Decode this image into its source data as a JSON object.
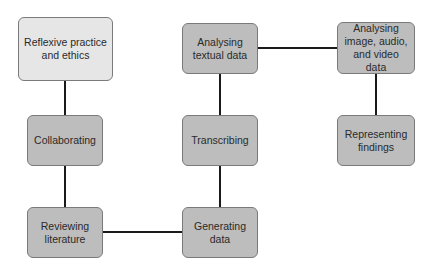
{
  "diagram": {
    "type": "flow",
    "nodes": [
      {
        "id": "reflexive",
        "label": "Reflexive practice\nand ethics",
        "fill": "#e6e6e6",
        "x": 18,
        "y": 17,
        "w": 95,
        "h": 64
      },
      {
        "id": "collaborating",
        "label": "Collaborating",
        "fill": "#bdbdbd",
        "x": 27,
        "y": 115,
        "w": 76,
        "h": 51
      },
      {
        "id": "reviewing",
        "label": "Reviewing\nliterature",
        "fill": "#bdbdbd",
        "x": 27,
        "y": 207,
        "w": 76,
        "h": 51
      },
      {
        "id": "generating",
        "label": "Generating\ndata",
        "fill": "#bdbdbd",
        "x": 182,
        "y": 207,
        "w": 76,
        "h": 51
      },
      {
        "id": "transcribing",
        "label": "Transcribing",
        "fill": "#bdbdbd",
        "x": 182,
        "y": 115,
        "w": 76,
        "h": 51
      },
      {
        "id": "textual",
        "label": "Analysing\ntextual data",
        "fill": "#bdbdbd",
        "x": 182,
        "y": 23,
        "w": 76,
        "h": 51
      },
      {
        "id": "image",
        "label": "Analysing\nimage, audio,\nand video data",
        "fill": "#bdbdbd",
        "x": 337,
        "y": 22,
        "w": 78,
        "h": 52
      },
      {
        "id": "representing",
        "label": "Representing\nfindings",
        "fill": "#bdbdbd",
        "x": 337,
        "y": 115,
        "w": 78,
        "h": 51
      }
    ],
    "edges": [
      {
        "from": "reflexive",
        "to": "collaborating"
      },
      {
        "from": "collaborating",
        "to": "reviewing"
      },
      {
        "from": "reviewing",
        "to": "generating"
      },
      {
        "from": "generating",
        "to": "transcribing"
      },
      {
        "from": "transcribing",
        "to": "textual"
      },
      {
        "from": "textual",
        "to": "image"
      },
      {
        "from": "image",
        "to": "representing"
      }
    ],
    "line_color": "#1a1a1a"
  }
}
